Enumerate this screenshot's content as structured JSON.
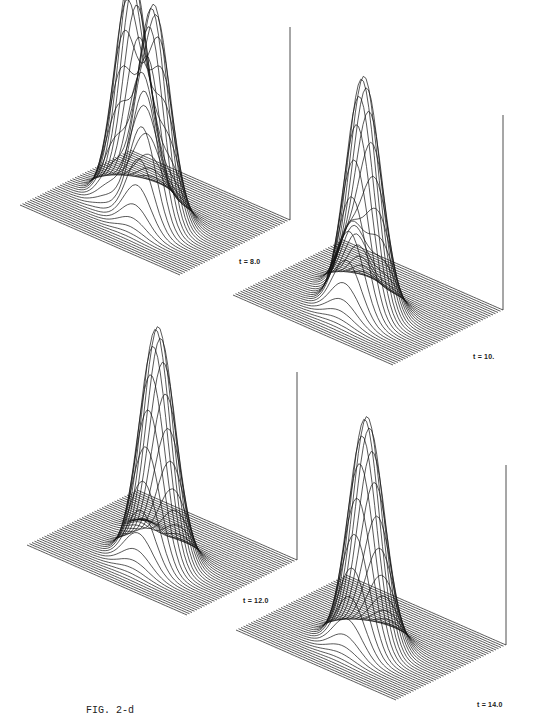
{
  "figure": {
    "caption": "FIG. 2-d",
    "panels": [
      {
        "id": "p1",
        "label": "t = 8.0",
        "peaks": [
          {
            "u": 0.34,
            "v": 0.52,
            "h": 225,
            "w": 0.085
          },
          {
            "u": 0.56,
            "v": 0.4,
            "h": 215,
            "w": 0.085
          }
        ],
        "origin": [
          20,
          230
        ],
        "label_pos": [
          253,
          263
        ],
        "axis_top": 27
      },
      {
        "id": "p2",
        "label": "t = 10.",
        "peaks": [
          {
            "u": 0.36,
            "v": 0.55,
            "h": 60,
            "w": 0.07
          },
          {
            "u": 0.54,
            "v": 0.4,
            "h": 235,
            "w": 0.09
          }
        ],
        "origin": [
          233,
          320
        ],
        "label_pos": [
          487,
          358
        ],
        "axis_top": 115
      },
      {
        "id": "p3",
        "label": "t = 12.0",
        "peaks": [
          {
            "u": 0.3,
            "v": 0.62,
            "h": 12,
            "w": 0.06
          },
          {
            "u": 0.54,
            "v": 0.4,
            "h": 235,
            "w": 0.09
          }
        ],
        "origin": [
          27,
          570
        ],
        "label_pos": [
          257,
          602
        ],
        "axis_top": 372
      },
      {
        "id": "p4",
        "label": "t = 14.0",
        "peaks": [
          {
            "u": 0.54,
            "v": 0.4,
            "h": 230,
            "w": 0.09
          }
        ],
        "origin": [
          236,
          655
        ],
        "label_pos": [
          491,
          706
        ],
        "axis_top": 465
      }
    ]
  },
  "chart_data": {
    "type": "surface-wireframe",
    "title": "FIG. 2-d",
    "panels": [
      {
        "label": "t = 8.0",
        "description": "Two tall, nearly equal peaks side by side"
      },
      {
        "label": "t = 10.",
        "description": "One tall peak and one small secondary peak"
      },
      {
        "label": "t = 12.0",
        "description": "One tall peak; secondary peak reduced to a small ripple"
      },
      {
        "label": "t = 14.0",
        "description": "Single tall peak"
      }
    ],
    "xlabel": "",
    "ylabel": "",
    "zlabel": ""
  }
}
